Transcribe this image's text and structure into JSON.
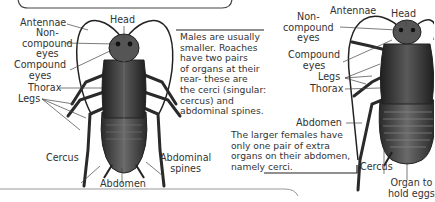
{
  "diagram": {
    "male": {
      "labels": {
        "antennae": "Antennae",
        "head": "Head",
        "non_compound_eyes": [
          "Non-",
          "compound",
          "eyes"
        ],
        "compound_eyes": [
          "Compound",
          "eyes"
        ],
        "thorax": "Thorax",
        "legs": "Legs",
        "cercus": "Cercus",
        "abdomen": "Abdomen",
        "abdominal_spines": [
          "Abdominal",
          "spines"
        ]
      },
      "note": [
        "Males are usually",
        "smaller. Roaches",
        "have two pairs",
        "of organs at their",
        "rear- these are",
        "the cerci (singular:",
        "cercus) and",
        "abdominal spines."
      ]
    },
    "female": {
      "labels": {
        "antennae": "Antennae",
        "head": "Head",
        "non_compound_eyes": [
          "Non-",
          "compound",
          "eyes"
        ],
        "compound_eyes": [
          "Compound",
          "eyes"
        ],
        "legs": "Legs",
        "thorax": "Thorax",
        "abdomen": "Abdomen",
        "cercus": "Cercus",
        "organ_eggs": [
          "Organ to",
          "hold eggs"
        ]
      },
      "note": [
        "The larger females have",
        "only one pair of extra",
        "organs on their abdomen,",
        "namely cerci."
      ]
    },
    "colors": {
      "body_dark": "#2b2b2b",
      "body_mid": "#555555",
      "body_light": "#8a8a8a",
      "line": "#333333",
      "frame": "#444444"
    }
  }
}
